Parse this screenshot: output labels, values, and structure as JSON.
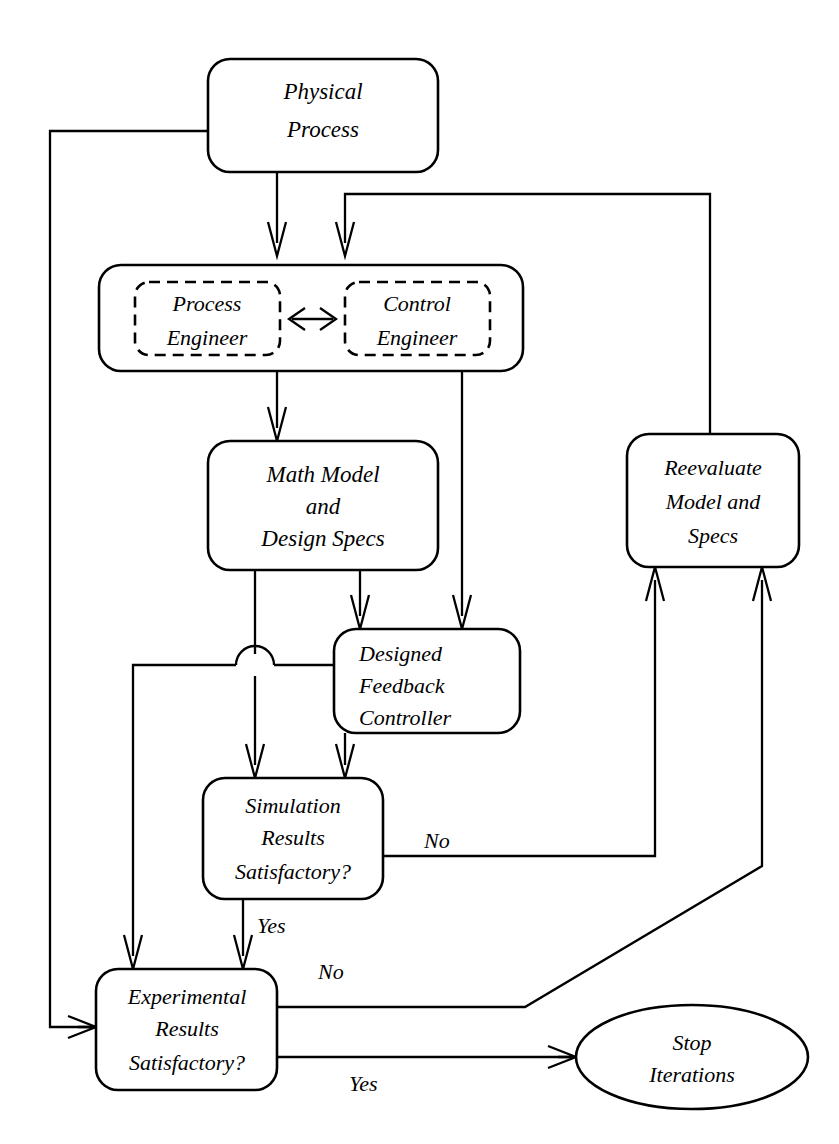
{
  "diagram": {
    "type": "flowchart",
    "nodes": [
      {
        "id": "physical_process",
        "shape": "rounded-rect",
        "lines": [
          "Physical",
          "Process"
        ],
        "align": "center"
      },
      {
        "id": "engineers_group",
        "shape": "rounded-rect",
        "lines": [],
        "align": "center"
      },
      {
        "id": "process_engineer",
        "shape": "rounded-rect-dashed",
        "lines": [
          "Process",
          "Engineer"
        ],
        "align": "center"
      },
      {
        "id": "control_engineer",
        "shape": "rounded-rect-dashed",
        "lines": [
          "Control",
          "Engineer"
        ],
        "align": "center"
      },
      {
        "id": "math_model",
        "shape": "rounded-rect",
        "lines": [
          "Math Model",
          "and",
          "Design Specs"
        ],
        "align": "center"
      },
      {
        "id": "designed_controller",
        "shape": "rounded-rect",
        "lines": [
          "Designed",
          "Feedback",
          "Controller"
        ],
        "align": "left"
      },
      {
        "id": "reevaluate",
        "shape": "rounded-rect",
        "lines": [
          "Reevaluate",
          "Model and",
          "Specs"
        ],
        "align": "center"
      },
      {
        "id": "simulation_results",
        "shape": "rounded-rect",
        "lines": [
          "Simulation",
          "Results",
          "Satisfactory?"
        ],
        "align": "center"
      },
      {
        "id": "experimental_results",
        "shape": "rounded-rect",
        "lines": [
          "Experimental",
          "Results",
          "Satisfactory?"
        ],
        "align": "center"
      },
      {
        "id": "stop_iterations",
        "shape": "ellipse",
        "lines": [
          "Stop",
          "Iterations"
        ],
        "align": "center"
      }
    ],
    "edge_labels": {
      "simulation_no": "No",
      "simulation_yes": "Yes",
      "experimental_no": "No",
      "experimental_yes": "Yes"
    },
    "colors": {
      "stroke": "#000000",
      "fill": "#ffffff",
      "background": "#ffffff"
    }
  }
}
